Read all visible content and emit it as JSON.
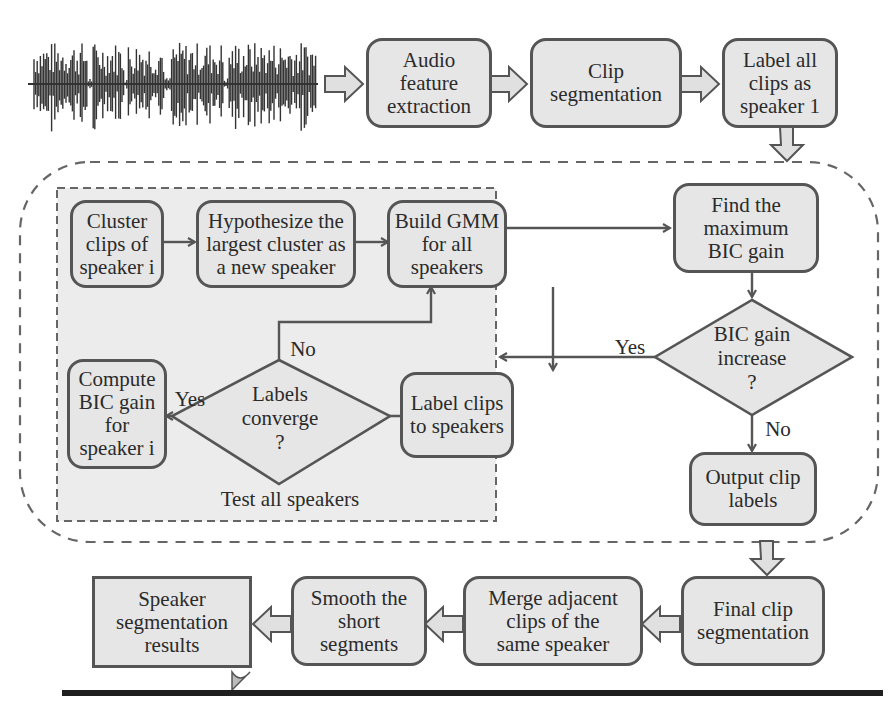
{
  "colors": {
    "node_fill": "#e6e6e6",
    "node_border": "#555555",
    "inner_panel_fill": "#eeeeee",
    "text": "#2b2b2b",
    "rule": "#1f1f1f"
  },
  "input": {
    "waveform": "audio-waveform"
  },
  "top_row": {
    "audio_feature_extraction": "Audio\nfeature\nextraction",
    "clip_segmentation": "Clip\nsegmentation",
    "label_all_clips": "Label all\nclips as\nspeaker 1"
  },
  "inner_loop": {
    "cluster_clips": "Cluster\nclips of\nspeaker i",
    "hypothesize": "Hypothesize the\nlargest cluster as\na new speaker",
    "build_gmm": "Build GMM\nfor all\nspeakers",
    "label_clips": "Label clips\nto speakers",
    "labels_converge": "Labels\nconverge\n?",
    "compute_bic": "Compute\nBIC gain\nfor\nspeaker i",
    "yes_label": "Yes",
    "no_label": "No",
    "caption": "Test all speakers"
  },
  "outer_loop": {
    "find_max_bic": "Find the\nmaximum\nBIC gain",
    "bic_increase": "BIC gain\nincrease\n?",
    "yes_label": "Yes",
    "no_label": "No",
    "output_labels": "Output clip\nlabels"
  },
  "bottom_row": {
    "final_clip_segmentation": "Final clip\nsegmentation",
    "merge_adjacent": "Merge adjacent\nclips of the\nsame speaker",
    "smooth_short": "Smooth the\nshort\nsegments",
    "speaker_results": "Speaker\nsegmentation\nresults"
  }
}
